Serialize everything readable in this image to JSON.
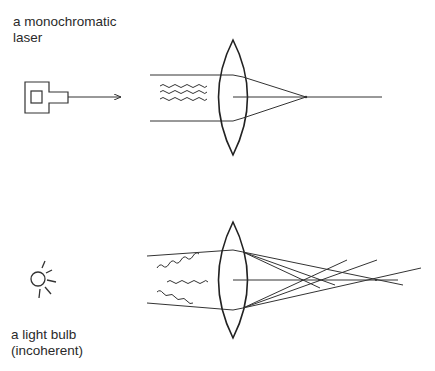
{
  "top_panel": {
    "label_line1": "a monochromatic",
    "label_line2": "laser",
    "source": "laser-icon",
    "description": "coherent parallel beam focused to a single point"
  },
  "bottom_panel": {
    "label_line1": "a light bulb",
    "label_line2": "(incoherent)",
    "source": "light-bulb-icon",
    "description": "incoherent rays focused to multiple scattered points"
  },
  "colors": {
    "stroke": "#333333",
    "background": "#ffffff"
  }
}
